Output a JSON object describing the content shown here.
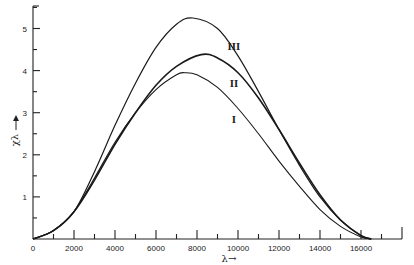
{
  "chart_data": {
    "type": "line",
    "title": "",
    "xlabel": "λ →",
    "ylabel": "χλ ↑",
    "xlim": [
      0,
      18000
    ],
    "ylim": [
      0,
      5.5
    ],
    "grid": false,
    "x_ticks_major": [
      0,
      2000,
      4000,
      6000,
      8000,
      10000,
      12000,
      14000,
      16000
    ],
    "x_ticks_minor": [
      1000,
      3000,
      5000,
      7000,
      9000,
      11000,
      13000,
      15000,
      17000,
      18000
    ],
    "y_ticks_major": [
      1,
      2,
      3,
      4,
      5
    ],
    "series": [
      {
        "name": "I",
        "x": [
          0,
          1000,
          2000,
          3000,
          4000,
          5000,
          6000,
          7000,
          7400,
          8000,
          9000,
          10000,
          11000,
          12000,
          13000,
          14000,
          15000,
          16000,
          16500
        ],
        "values": [
          0,
          0.2,
          0.65,
          1.45,
          2.3,
          3.0,
          3.55,
          3.9,
          3.95,
          3.9,
          3.6,
          3.1,
          2.5,
          1.85,
          1.25,
          0.7,
          0.3,
          0.05,
          0
        ],
        "label_position": {
          "x": 9800,
          "y": 2.75
        }
      },
      {
        "name": "II",
        "x": [
          0,
          1000,
          2000,
          3000,
          4000,
          5000,
          6000,
          7000,
          8200,
          9000,
          10000,
          11000,
          12000,
          13000,
          14000,
          15000,
          16000,
          16500
        ],
        "values": [
          0,
          0.2,
          0.65,
          1.4,
          2.25,
          3.0,
          3.65,
          4.1,
          4.38,
          4.3,
          3.95,
          3.35,
          2.6,
          1.8,
          1.05,
          0.45,
          0.08,
          0
        ],
        "label_position": {
          "x": 9800,
          "y": 3.6
        }
      },
      {
        "name": "III",
        "x": [
          0,
          1000,
          2000,
          3000,
          4000,
          5000,
          6000,
          7000,
          7800,
          9000,
          10000,
          11000,
          12000,
          13000,
          14000,
          15000,
          16000,
          16500
        ],
        "values": [
          0,
          0.2,
          0.65,
          1.6,
          2.7,
          3.7,
          4.55,
          5.1,
          5.25,
          5.0,
          4.35,
          3.5,
          2.6,
          1.75,
          1.0,
          0.45,
          0.08,
          0
        ],
        "label_position": {
          "x": 9800,
          "y": 4.5
        }
      }
    ]
  },
  "labels": {
    "x_axis": "λ→",
    "y_axis": "χλ",
    "curve_I": "I",
    "curve_II": "II",
    "curve_III": "III"
  }
}
